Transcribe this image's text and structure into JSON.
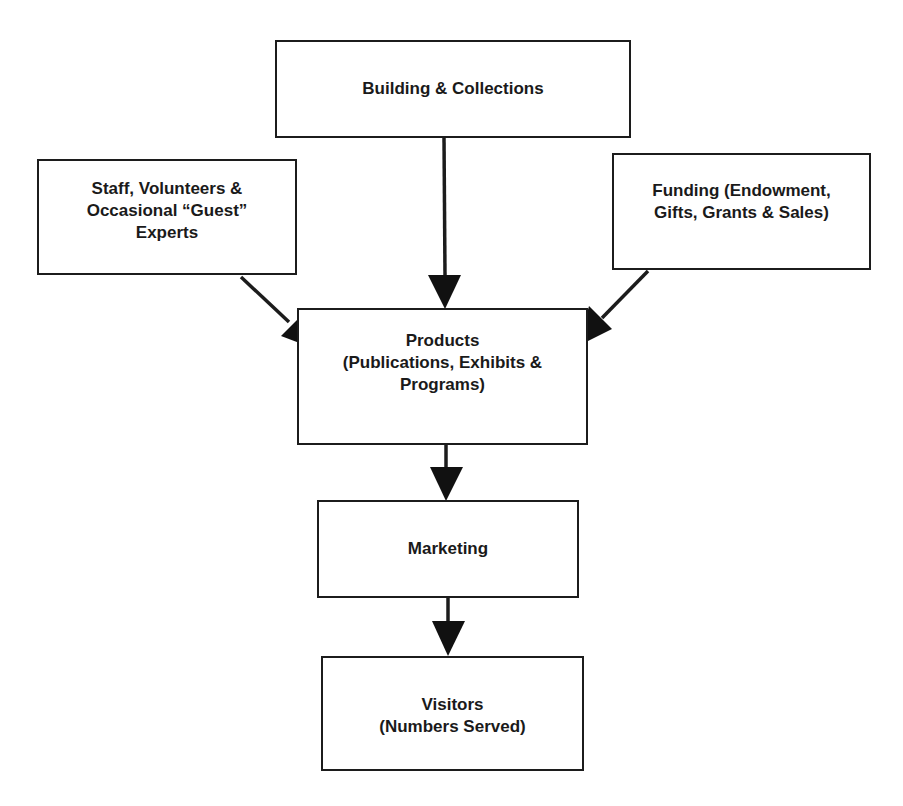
{
  "diagram": {
    "type": "flowchart",
    "nodes": [
      {
        "id": "building",
        "label": "Building & Collections"
      },
      {
        "id": "staff",
        "label": "Staff, Volunteers &\nOccasional “Guest”\nExperts"
      },
      {
        "id": "funding",
        "label": "Funding (Endowment,\nGifts, Grants & Sales)"
      },
      {
        "id": "products",
        "label": "Products\n(Publications, Exhibits &\nPrograms)"
      },
      {
        "id": "marketing",
        "label": "Marketing"
      },
      {
        "id": "visitors",
        "label": "Visitors\n(Numbers Served)"
      }
    ],
    "edges": [
      {
        "from": "building",
        "to": "products"
      },
      {
        "from": "staff",
        "to": "products"
      },
      {
        "from": "funding",
        "to": "products"
      },
      {
        "from": "products",
        "to": "marketing"
      },
      {
        "from": "marketing",
        "to": "visitors"
      }
    ],
    "colors": {
      "stroke": "#1c1c1c",
      "fill": "#ffffff",
      "text": "#1a1a1a"
    }
  }
}
